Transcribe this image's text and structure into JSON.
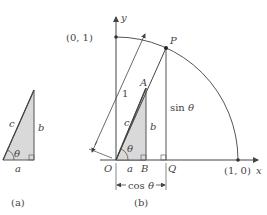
{
  "figure_a": {
    "caption": "(a)",
    "labels": {
      "hypotenuse": "c",
      "opposite": "b",
      "adjacent": "a",
      "angle": "θ"
    }
  },
  "figure_b": {
    "caption": "(b)",
    "axes": {
      "x_label": "x",
      "y_label": "y"
    },
    "points": {
      "origin": "O",
      "y_intercept": "(0, 1)",
      "x_intercept": "(1, 0)",
      "P": "P",
      "A": "A",
      "B": "B",
      "Q": "Q"
    },
    "labels": {
      "radius": "1",
      "hypotenuse": "c",
      "opposite": "b",
      "adjacent": "a",
      "angle": "θ",
      "sin": "sin θ",
      "cos": "cos θ"
    }
  },
  "colors": {
    "fill": "#d9d9d9",
    "stroke": "#555555",
    "text": "#444444"
  }
}
